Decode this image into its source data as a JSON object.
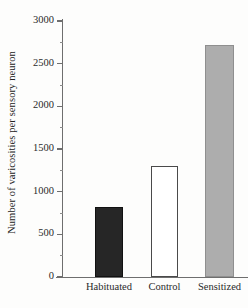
{
  "chart_data": {
    "type": "bar",
    "title": "",
    "xlabel": "",
    "ylabel": "Number of varicosities per sensory neuron",
    "categories": [
      "Habituated",
      "Control",
      "Sensitized"
    ],
    "values": [
      820,
      1300,
      2720
    ],
    "ylim": [
      0,
      3000
    ],
    "y_major_ticks": [
      0,
      500,
      1000,
      1500,
      2000,
      2500,
      3000
    ],
    "y_major_tick_labels": [
      "0",
      "500",
      "1000",
      "1500",
      "2000",
      "2500",
      "3000"
    ],
    "y_minor_ticks": [
      250,
      750,
      1250,
      1750,
      2250,
      2750
    ],
    "grid": false,
    "legend": "none",
    "bar_styles": [
      {
        "name": "Habituated",
        "fill": "#262626",
        "edge": "#111111",
        "style": "solid"
      },
      {
        "name": "Control",
        "fill": "#ffffff",
        "edge": "#4a4a4a",
        "style": "open"
      },
      {
        "name": "Sensitized",
        "fill": "#adadad",
        "edge": "#8f8f8f",
        "style": "solid"
      }
    ]
  },
  "axis": {
    "y_title": "Number of varicosities per sensory neuron",
    "tick_0": "0",
    "tick_500": "500",
    "tick_1000": "1000",
    "tick_1500": "1500",
    "tick_2000": "2000",
    "tick_2500": "2500",
    "tick_3000": "3000"
  },
  "categories": {
    "habituated": "Habituated",
    "control": "Control",
    "sensitized": "Sensitized"
  }
}
